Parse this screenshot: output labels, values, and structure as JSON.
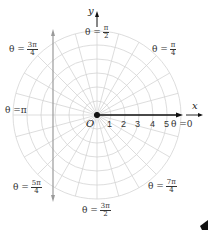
{
  "diagram": {
    "title": "",
    "origin_label": "O",
    "x_axis_label": "x",
    "y_axis_label": "y",
    "radial_ticks": [
      "1",
      "2",
      "3",
      "4",
      "5"
    ],
    "angle_labels": [
      {
        "id": "theta-0",
        "prefix": "θ = ",
        "value": "0"
      },
      {
        "id": "theta-pi-over-4",
        "prefix": "θ = ",
        "num": "π",
        "den": "4"
      },
      {
        "id": "theta-pi-over-2",
        "prefix": "θ = ",
        "num": "π",
        "den": "2"
      },
      {
        "id": "theta-3pi-over-4",
        "prefix": "θ = ",
        "num": "3π",
        "den": "4"
      },
      {
        "id": "theta-pi",
        "prefix": "θ = ",
        "value": "π"
      },
      {
        "id": "theta-5pi-over-4",
        "prefix": "θ = ",
        "num": "5π",
        "den": "4"
      },
      {
        "id": "theta-3pi-over-2",
        "prefix": "θ = ",
        "num": "3π",
        "den": "2"
      },
      {
        "id": "theta-7pi-over-4",
        "prefix": "θ = ",
        "num": "7π",
        "den": "4"
      }
    ],
    "colors": {
      "grid": "#d4d4d4",
      "axis": "#111111",
      "vertical_line": "#9a9a9a",
      "text": "#333333"
    }
  }
}
